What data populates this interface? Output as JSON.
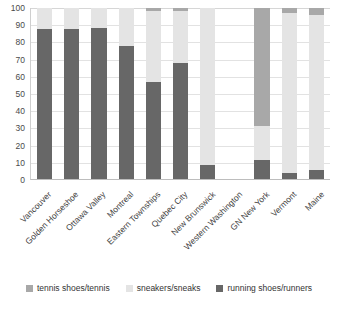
{
  "chart_data": {
    "type": "bar",
    "subtype": "100% stacked column",
    "title": "",
    "xlabel": "",
    "ylabel": "",
    "ylim": [
      0,
      100
    ],
    "yticks": [
      0,
      10,
      20,
      30,
      40,
      50,
      60,
      70,
      80,
      90,
      100
    ],
    "grid": true,
    "legend_position": "bottom",
    "categories": [
      "Vancouver",
      "Golden Horseshoe",
      "Ottawa Valley",
      "Montreal",
      "Eastern Townships",
      "Quebec City",
      "New Brunswick",
      "Western Washington",
      "GN New York",
      "Vermont",
      "Maine"
    ],
    "series": [
      {
        "name": "running shoes/runners",
        "color": "#676767",
        "values": [
          88,
          87.5,
          88.5,
          77.5,
          56.5,
          68,
          8,
          0,
          11,
          3.5,
          5
        ]
      },
      {
        "name": "sneakers/sneaks",
        "color": "#e4e4e4",
        "values": [
          12,
          12.5,
          11.5,
          22.5,
          41.5,
          30,
          92,
          0,
          20,
          93.5,
          91
        ]
      },
      {
        "name": "tennis shoes/tennis",
        "color": "#a8a8a8",
        "values": [
          0,
          0,
          0,
          0,
          2,
          2,
          0,
          0,
          69,
          3,
          4
        ]
      }
    ]
  },
  "legend": {
    "items": [
      {
        "label": "tennis shoes/tennis",
        "color": "#a8a8a8"
      },
      {
        "label": "sneakers/sneaks",
        "color": "#e4e4e4"
      },
      {
        "label": "running shoes/runners",
        "color": "#676767"
      }
    ]
  }
}
